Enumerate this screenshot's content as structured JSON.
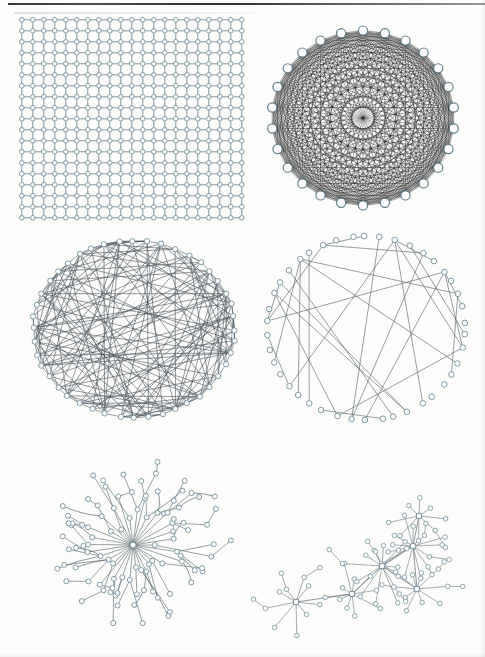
{
  "figure": {
    "background_color": "#fdfdfc",
    "node_stroke_color": "#7e9aa4",
    "node_fill_color": "#ffffff",
    "edge_color": "#56616b",
    "dense_edge_color": "#1c1c1c",
    "panel_count": 6
  },
  "panels": [
    {
      "id": "regular-lattice",
      "label": "Regular lattice (grid) network",
      "type": "lattice",
      "position": {
        "x": 18,
        "y": 16,
        "w": 232,
        "h": 214
      },
      "rows": 19,
      "cols": 21,
      "spacing_x": 11.0,
      "spacing_y": 11.0,
      "node_radius": 2.3,
      "edge_width": 1.0,
      "edge_color": "#6f8790",
      "node_stroke": "#7e9aa4",
      "node_count": 399,
      "edge_count": 758
    },
    {
      "id": "complete-graph",
      "label": "Complete (fully connected) graph",
      "type": "complete-circular",
      "position": {
        "x": 258,
        "y": 18,
        "w": 210,
        "h": 200
      },
      "center": {
        "x": 363,
        "y": 118
      },
      "radius_x": 97,
      "radius_y": 93,
      "node_count": 26,
      "node_radius": 4.6,
      "edge_width": 0.45,
      "edge_color": "#161616",
      "edge_opacity": 0.9,
      "edge_count": 325,
      "rotation_deg": -90
    },
    {
      "id": "random-graph-dense",
      "label": "Random graph, dense (Erdos-Renyi)",
      "type": "random-circular",
      "position": {
        "x": 24,
        "y": 236,
        "w": 220,
        "h": 186
      },
      "center": {
        "x": 134,
        "y": 329
      },
      "radius_x": 105,
      "radius_y": 92,
      "node_count": 44,
      "node_radius": 2.6,
      "edge_width": 0.7,
      "edge_color": "#4a535c",
      "edge_count": 150,
      "seed": 20914
    },
    {
      "id": "random-graph-sparse",
      "label": "Random graph, sparse",
      "type": "random-circular-sparse",
      "position": {
        "x": 258,
        "y": 232,
        "w": 216,
        "h": 192
      },
      "center": {
        "x": 366,
        "y": 328
      },
      "radius_x": 103,
      "radius_y": 96,
      "node_count": 42,
      "node_radius": 2.8,
      "edge_width": 0.7,
      "edge_color": "#5a646d",
      "edge_count": 28,
      "seed": 7731
    },
    {
      "id": "star-tree",
      "label": "Star / hub-and-spoke tree network",
      "type": "star-tree",
      "position": {
        "x": 28,
        "y": 436,
        "w": 210,
        "h": 218
      },
      "hub": {
        "x": 131,
        "y": 545
      },
      "spokes": 34,
      "mid_radius": 36,
      "leaf_radius": 78,
      "node_radius": 2.5,
      "edge_width": 0.7,
      "edge_color": "#5d6a6e",
      "node_count": 103,
      "seed": 4452
    },
    {
      "id": "scale-free",
      "label": "Scale-free / preferential attachment network",
      "type": "scale-free",
      "position": {
        "x": 258,
        "y": 462,
        "w": 220,
        "h": 186
      },
      "hubs": [
        {
          "x": 296,
          "y": 602,
          "spokes": 9,
          "spread": 26
        },
        {
          "x": 352,
          "y": 594,
          "spokes": 10,
          "spread": 25
        },
        {
          "x": 382,
          "y": 566,
          "spokes": 14,
          "spread": 31
        },
        {
          "x": 417,
          "y": 589,
          "spokes": 10,
          "spread": 26
        },
        {
          "x": 413,
          "y": 546,
          "spokes": 13,
          "spread": 33
        },
        {
          "x": 419,
          "y": 516,
          "spokes": 8,
          "spread": 24
        }
      ],
      "node_radius": 2.3,
      "edge_width": 0.65,
      "edge_color": "#6a737a",
      "node_count": 76,
      "seed": 3301
    }
  ]
}
